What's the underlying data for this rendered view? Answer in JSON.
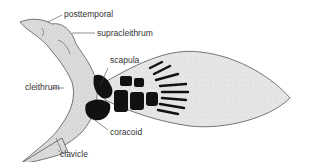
{
  "diagram": {
    "colors": {
      "bone_fill": "#d4d4d4",
      "fin_fill": "#e2e2e2",
      "ossified": "#111111",
      "outline": "#555555",
      "text": "#333333"
    },
    "labels": [
      {
        "id": "posttemporal",
        "text": "posttemporal"
      },
      {
        "id": "supracleithrum",
        "text": "supracleithrum"
      },
      {
        "id": "scapula",
        "text": "scapula"
      },
      {
        "id": "cleithrum",
        "text": "cleithrum"
      },
      {
        "id": "coracoid",
        "text": "coracoid"
      },
      {
        "id": "clavicle",
        "text": "clavicle"
      }
    ]
  }
}
